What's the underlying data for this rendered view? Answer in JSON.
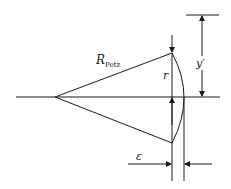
{
  "diagram": {
    "labels": {
      "radius_main": "R",
      "radius_sub": "Petz",
      "height_r": "r",
      "height_y": "y′",
      "sag": "ε"
    },
    "colors": {
      "line": "#1a1a1a",
      "background": "#ffffff"
    }
  }
}
